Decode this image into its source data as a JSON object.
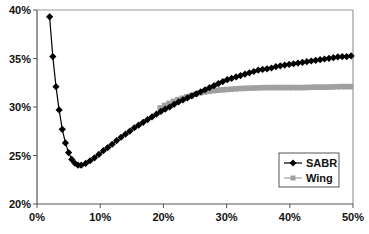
{
  "chart_data": {
    "type": "line",
    "title": "",
    "xlabel": "",
    "ylabel": "",
    "xlim": [
      0,
      50
    ],
    "ylim": [
      20,
      40
    ],
    "x_ticks": [
      "0%",
      "10%",
      "20%",
      "30%",
      "40%",
      "50%"
    ],
    "y_ticks": [
      "20%",
      "25%",
      "30%",
      "35%",
      "40%"
    ],
    "grid": false,
    "legend_position": "lower right, inside plot",
    "series": [
      {
        "name": "SABR",
        "color": "#000000",
        "marker": "diamond",
        "x": [
          2.0,
          2.5,
          3.0,
          3.5,
          4.0,
          4.5,
          5.0,
          5.5,
          6.0,
          6.5,
          7.0,
          7.5,
          8.0,
          8.5,
          9.0,
          9.5,
          10,
          10.5,
          11,
          11.5,
          12,
          12.5,
          13,
          13.5,
          14,
          14.5,
          15,
          15.5,
          16,
          16.5,
          17,
          17.5,
          18,
          18.5,
          19,
          19.5,
          20,
          21,
          22,
          23,
          24,
          25,
          26,
          27,
          28,
          29,
          30,
          31,
          32,
          33,
          34,
          35,
          36,
          37,
          38,
          39,
          40,
          41,
          42,
          43,
          44,
          45,
          46,
          47,
          48,
          49,
          50
        ],
        "y": [
          39.3,
          35.2,
          32.1,
          29.7,
          27.7,
          26.3,
          25.3,
          24.6,
          24.2,
          24.0,
          24.0,
          24.1,
          24.3,
          24.5,
          24.7,
          25.0,
          25.2,
          25.5,
          25.7,
          26.0,
          26.2,
          26.5,
          26.7,
          27.0,
          27.2,
          27.4,
          27.7,
          27.9,
          28.1,
          28.3,
          28.5,
          28.7,
          28.9,
          29.1,
          29.3,
          29.5,
          29.7,
          30.0,
          30.4,
          30.7,
          31.0,
          31.3,
          31.6,
          31.9,
          32.2,
          32.5,
          32.8,
          33.0,
          33.2,
          33.4,
          33.6,
          33.8,
          33.9,
          34.0,
          34.2,
          34.3,
          34.4,
          34.5,
          34.6,
          34.7,
          34.8,
          34.9,
          35.0,
          35.1,
          35.2,
          35.2,
          35.3
        ]
      },
      {
        "name": "Wing",
        "color": "#a0a0a0",
        "marker": "square",
        "x": [
          19.5,
          20,
          21,
          22,
          23,
          24,
          25,
          26,
          27,
          28,
          29,
          30,
          32,
          34,
          36,
          38,
          40,
          42,
          44,
          46,
          48,
          50
        ],
        "y": [
          29.9,
          30.1,
          30.4,
          30.7,
          30.9,
          31.1,
          31.3,
          31.5,
          31.6,
          31.7,
          31.75,
          31.8,
          31.9,
          31.95,
          32.0,
          32.0,
          32.0,
          32.0,
          32.05,
          32.05,
          32.1,
          32.1
        ]
      }
    ]
  },
  "legend": {
    "items": [
      {
        "label": "SABR",
        "icon": "diamond-marker",
        "color": "#000000"
      },
      {
        "label": "Wing",
        "icon": "square-marker",
        "color": "#a0a0a0"
      }
    ]
  }
}
